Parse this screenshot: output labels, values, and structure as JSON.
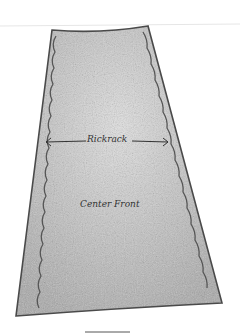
{
  "figure": {
    "labels": {
      "rickrack": "Rickrack",
      "center_front": "Center Front"
    },
    "colors": {
      "background": "#ffffff",
      "fill": "#bdbdbd",
      "outline": "#4a4a4a"
    }
  }
}
